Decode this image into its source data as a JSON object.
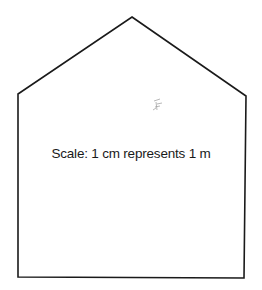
{
  "diagram": {
    "shape": "pentagon-house",
    "stroke_color": "#1a1a1a",
    "vertices": {
      "apex": [
        132,
        17
      ],
      "left_shoulder": [
        18,
        94
      ],
      "right_shoulder": [
        246,
        96
      ],
      "bottom_right": [
        244,
        278
      ],
      "bottom_left": [
        18,
        277
      ]
    },
    "scale_label": "Scale: 1 cm represents 1 m",
    "smudge_mark": {
      "icon": "pencil-smudge-icon",
      "position": [
        158,
        105
      ],
      "color": "#9a9a9a"
    }
  }
}
